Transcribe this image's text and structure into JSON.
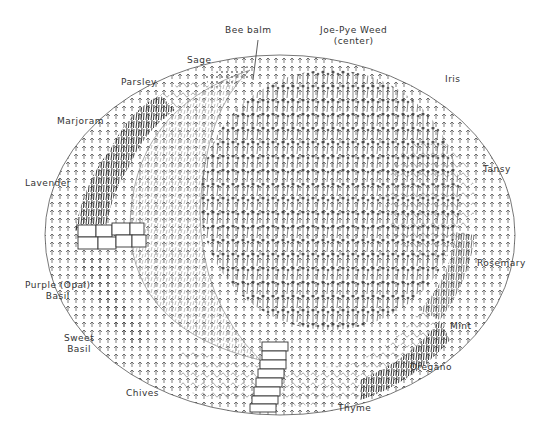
{
  "labels": {
    "bee_balm": "Bee balm",
    "joe_pye_1": "Joe-Pye Weed",
    "joe_pye_2": "(center)",
    "sage": "Sage",
    "parsley": "Parsley",
    "iris": "Iris",
    "marjoram": "Marjoram",
    "tansy": "Tansy",
    "lavender": "Lavender",
    "rosemary": "Rosemary",
    "purple_basil_1": "Purple (Opal)",
    "purple_basil_2": "Basil",
    "sweet_basil_1": "Sweet",
    "sweet_basil_2": "Basil",
    "mint": "Mint",
    "oregano": "Oregano",
    "chives": "Chives",
    "thyme": "Thyme"
  }
}
